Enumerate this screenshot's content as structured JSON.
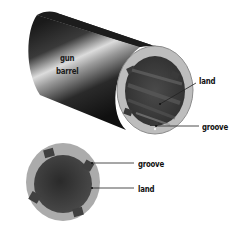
{
  "diagram": {
    "labels": {
      "barrel_line1": "gun",
      "barrel_line2": "barrel",
      "land_top": "land",
      "groove_top": "groove",
      "groove_bottom": "groove",
      "land_bottom": "land"
    },
    "parts": [
      {
        "id": "gun-barrel",
        "label": "gun barrel",
        "view": "3D"
      },
      {
        "id": "land",
        "label": "land",
        "view": "3D end"
      },
      {
        "id": "groove",
        "label": "groove",
        "view": "3D end"
      },
      {
        "id": "groove",
        "label": "groove",
        "view": "cross-section"
      },
      {
        "id": "land",
        "label": "land",
        "view": "cross-section"
      }
    ],
    "colors": {
      "barrel_dark": "#1e1e1e",
      "barrel_highlight": "#d8d8d8",
      "rim": "#b8b8b8",
      "bore_dark": "#3a3a3a",
      "section_outer": "#a9a9a9",
      "section_inner": "#3c3c3c",
      "leader_line": "#222222"
    }
  }
}
